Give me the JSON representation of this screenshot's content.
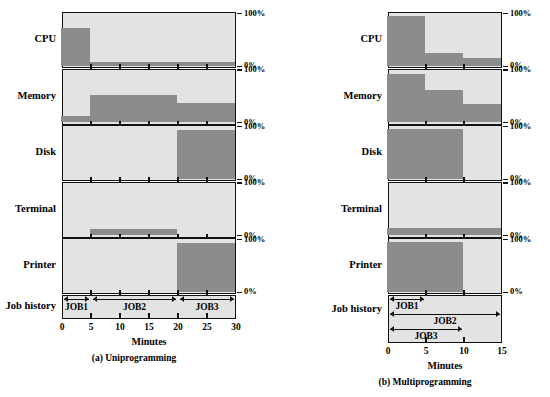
{
  "charts": [
    {
      "id": "a",
      "caption": "(a) Uniprogramming",
      "xlabel": "Minutes",
      "job_history_label": "Job history",
      "resources": [
        "CPU",
        "Memory",
        "Disk",
        "Terminal",
        "Printer"
      ],
      "y_top_label": "100%",
      "y_bottom_label": "0%",
      "x_ticks": [
        "0",
        "5",
        "10",
        "15",
        "20",
        "25",
        "30"
      ],
      "jobs": [
        {
          "label": "JOB1",
          "start": 0,
          "end": 5
        },
        {
          "label": "JOB2",
          "start": 5,
          "end": 20
        },
        {
          "label": "JOB3",
          "start": 20,
          "end": 30
        }
      ]
    },
    {
      "id": "b",
      "caption": "(b) Multiprogramming",
      "xlabel": "Minutes",
      "job_history_label": "Job history",
      "resources": [
        "CPU",
        "Memory",
        "Disk",
        "Terminal",
        "Printer"
      ],
      "y_top_label": "100%",
      "y_bottom_label": "0%",
      "x_ticks": [
        "0",
        "5",
        "10",
        "15"
      ],
      "jobs": [
        {
          "label": "JOB1",
          "start": 0,
          "end": 5
        },
        {
          "label": "JOB2",
          "start": 0,
          "end": 15
        },
        {
          "label": "JOB3",
          "start": 0,
          "end": 10
        }
      ]
    }
  ],
  "chart_data": [
    {
      "type": "area",
      "title": "(a) Uniprogramming",
      "xlabel": "Minutes",
      "ylabel": "Utilization",
      "xlim": [
        0,
        30
      ],
      "ylim": [
        0,
        100
      ],
      "xtick_values": [
        0,
        5,
        10,
        15,
        20,
        25,
        30
      ],
      "xtick_labels": [
        "0",
        "5",
        "10",
        "15",
        "20",
        "25",
        "30"
      ],
      "ytick_values": [
        0,
        100
      ],
      "ytick_labels": [
        "0%",
        "100%"
      ],
      "grid": false,
      "legend": "none",
      "panels": [
        {
          "name": "CPU",
          "steps": [
            {
              "x0": 0,
              "x1": 5,
              "value": 72
            },
            {
              "x0": 5,
              "x1": 30,
              "value": 8
            }
          ]
        },
        {
          "name": "Memory",
          "steps": [
            {
              "x0": 0,
              "x1": 5,
              "value": 12
            },
            {
              "x0": 5,
              "x1": 20,
              "value": 52
            },
            {
              "x0": 20,
              "x1": 30,
              "value": 36
            }
          ]
        },
        {
          "name": "Disk",
          "steps": [
            {
              "x0": 0,
              "x1": 20,
              "value": 0
            },
            {
              "x0": 20,
              "x1": 30,
              "value": 92
            }
          ]
        },
        {
          "name": "Terminal",
          "steps": [
            {
              "x0": 0,
              "x1": 5,
              "value": 0
            },
            {
              "x0": 5,
              "x1": 20,
              "value": 12
            },
            {
              "x0": 20,
              "x1": 30,
              "value": 0
            }
          ]
        },
        {
          "name": "Printer",
          "steps": [
            {
              "x0": 0,
              "x1": 20,
              "value": 0
            },
            {
              "x0": 20,
              "x1": 30,
              "value": 92
            }
          ]
        }
      ],
      "job_history": [
        {
          "label": "JOB1",
          "start": 0,
          "end": 5
        },
        {
          "label": "JOB2",
          "start": 5,
          "end": 20
        },
        {
          "label": "JOB3",
          "start": 20,
          "end": 30
        }
      ]
    },
    {
      "type": "area",
      "title": "(b) Multiprogramming",
      "xlabel": "Minutes",
      "ylabel": "Utilization",
      "xlim": [
        0,
        15
      ],
      "ylim": [
        0,
        100
      ],
      "xtick_values": [
        0,
        5,
        10,
        15
      ],
      "xtick_labels": [
        "0",
        "5",
        "10",
        "15"
      ],
      "ytick_values": [
        0,
        100
      ],
      "ytick_labels": [
        "0%",
        "100%"
      ],
      "grid": false,
      "legend": "none",
      "panels": [
        {
          "name": "CPU",
          "steps": [
            {
              "x0": 0,
              "x1": 5,
              "value": 95
            },
            {
              "x0": 5,
              "x1": 10,
              "value": 25
            },
            {
              "x0": 10,
              "x1": 15,
              "value": 14
            }
          ]
        },
        {
          "name": "Memory",
          "steps": [
            {
              "x0": 0,
              "x1": 5,
              "value": 92
            },
            {
              "x0": 5,
              "x1": 10,
              "value": 62
            },
            {
              "x0": 10,
              "x1": 15,
              "value": 34
            }
          ]
        },
        {
          "name": "Disk",
          "steps": [
            {
              "x0": 0,
              "x1": 10,
              "value": 95
            },
            {
              "x0": 10,
              "x1": 15,
              "value": 0
            }
          ]
        },
        {
          "name": "Terminal",
          "steps": [
            {
              "x0": 0,
              "x1": 15,
              "value": 14
            }
          ]
        },
        {
          "name": "Printer",
          "steps": [
            {
              "x0": 0,
              "x1": 10,
              "value": 95
            },
            {
              "x0": 10,
              "x1": 15,
              "value": 0
            }
          ]
        }
      ],
      "job_history": [
        {
          "label": "JOB1",
          "start": 0,
          "end": 5
        },
        {
          "label": "JOB2",
          "start": 0,
          "end": 15
        },
        {
          "label": "JOB3",
          "start": 0,
          "end": 10
        }
      ]
    }
  ],
  "colors": {
    "panel_background": "#e3e3e3",
    "bar_fill": "#8c8c8c",
    "axis": "#111111",
    "page_background": "#ffffff"
  }
}
